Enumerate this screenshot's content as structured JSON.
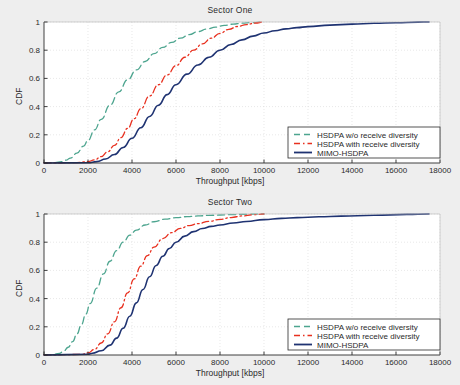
{
  "figure": {
    "background_color": "#eeeeee",
    "plot_background_color": "#ffffff"
  },
  "colors": {
    "series_green": "#4da58f",
    "series_red": "#e8301f",
    "series_navy": "#1f3372",
    "axis": "#2a2a2a",
    "grid": "#d8d8d8"
  },
  "legend": {
    "items": [
      {
        "label": "HSDPA w/o receive diversity",
        "color": "#4da58f",
        "style": "dashed"
      },
      {
        "label": "HSDPA with receive diversity",
        "color": "#e8301f",
        "style": "dash-dot"
      },
      {
        "label": "MIMO-HSDPA",
        "color": "#1f3372",
        "style": "solid"
      }
    ],
    "position": "lower right"
  },
  "chart_data": [
    {
      "type": "line",
      "title": "Sector One",
      "xlabel": "Throughput [kbps]",
      "ylabel": "CDF",
      "xlim": [
        0,
        18000
      ],
      "ylim": [
        0,
        1
      ],
      "xticks": [
        0,
        2000,
        4000,
        6000,
        8000,
        10000,
        12000,
        14000,
        16000,
        18000
      ],
      "yticks": [
        0,
        0.2,
        0.4,
        0.6,
        0.8,
        1
      ],
      "xticklabels": [
        "0",
        "2000",
        "4000",
        "6000",
        "8000",
        "10000",
        "12000",
        "14000",
        "16000",
        "18000"
      ],
      "yticklabels": [
        "0",
        "0.2",
        "0.4",
        "0.6",
        "0.8",
        "1"
      ],
      "grid": true,
      "legend_position": "lower right",
      "series": [
        {
          "name": "HSDPA w/o receive diversity",
          "color": "#4da58f",
          "style": "dashed",
          "x": [
            0,
            500,
            800,
            1000,
            1200,
            1500,
            1800,
            2000,
            2300,
            2600,
            3000,
            3400,
            3800,
            4200,
            4600,
            5000,
            5400,
            5800,
            6200,
            6600,
            7000,
            7400,
            7800,
            8200,
            8600,
            9000,
            9400,
            10000
          ],
          "y": [
            0,
            0.003,
            0.01,
            0.02,
            0.035,
            0.07,
            0.12,
            0.16,
            0.235,
            0.31,
            0.41,
            0.505,
            0.59,
            0.66,
            0.72,
            0.775,
            0.82,
            0.855,
            0.885,
            0.91,
            0.932,
            0.95,
            0.964,
            0.976,
            0.985,
            0.992,
            0.996,
            1.0
          ]
        },
        {
          "name": "HSDPA with receive diversity",
          "color": "#e8301f",
          "style": "dash-dot",
          "x": [
            0,
            1500,
            2000,
            2300,
            2600,
            2900,
            3200,
            3500,
            3800,
            4100,
            4400,
            4800,
            5200,
            5600,
            6000,
            6400,
            6800,
            7200,
            7600,
            8000,
            8400,
            8800,
            9200,
            9600,
            10000
          ],
          "y": [
            0,
            0.003,
            0.01,
            0.022,
            0.045,
            0.08,
            0.125,
            0.18,
            0.245,
            0.315,
            0.385,
            0.475,
            0.555,
            0.625,
            0.69,
            0.75,
            0.8,
            0.845,
            0.885,
            0.92,
            0.948,
            0.968,
            0.982,
            0.993,
            1.0
          ]
        },
        {
          "name": "MIMO-HSDPA",
          "color": "#1f3372",
          "style": "solid",
          "x": [
            0,
            2000,
            2400,
            2800,
            3200,
            3600,
            4000,
            4400,
            4800,
            5200,
            5600,
            6000,
            6500,
            7000,
            7500,
            8000,
            8500,
            9000,
            9500,
            10000,
            10500,
            11000,
            11500,
            12000,
            13000,
            14000,
            15000,
            16000,
            17000,
            17500
          ],
          "y": [
            0,
            0.002,
            0.01,
            0.028,
            0.06,
            0.11,
            0.175,
            0.25,
            0.33,
            0.41,
            0.485,
            0.555,
            0.63,
            0.695,
            0.75,
            0.8,
            0.84,
            0.873,
            0.9,
            0.922,
            0.938,
            0.951,
            0.96,
            0.967,
            0.978,
            0.985,
            0.991,
            0.995,
            0.999,
            1.0
          ]
        }
      ]
    },
    {
      "type": "line",
      "title": "Sector Two",
      "xlabel": "Throughput [kbps]",
      "ylabel": "CDF",
      "xlim": [
        0,
        18000
      ],
      "ylim": [
        0,
        1
      ],
      "xticks": [
        0,
        2000,
        4000,
        6000,
        8000,
        10000,
        12000,
        14000,
        16000,
        18000
      ],
      "yticks": [
        0,
        0.2,
        0.4,
        0.6,
        0.8,
        1
      ],
      "xticklabels": [
        "0",
        "2000",
        "4000",
        "6000",
        "8000",
        "10000",
        "12000",
        "14000",
        "16000",
        "18000"
      ],
      "yticklabels": [
        "0",
        "0.2",
        "0.4",
        "0.6",
        "0.8",
        "1"
      ],
      "grid": true,
      "legend_position": "lower right",
      "series": [
        {
          "name": "HSDPA w/o receive diversity",
          "color": "#4da58f",
          "style": "dashed",
          "x": [
            0,
            400,
            700,
            900,
            1100,
            1300,
            1500,
            1700,
            1900,
            2100,
            2400,
            2700,
            3000,
            3300,
            3600,
            3900,
            4200,
            4600,
            5000,
            5500,
            6000,
            6500,
            7000,
            7500,
            8000,
            8600,
            9200,
            10000
          ],
          "y": [
            0,
            0.003,
            0.012,
            0.028,
            0.055,
            0.095,
            0.15,
            0.215,
            0.29,
            0.365,
            0.475,
            0.575,
            0.665,
            0.74,
            0.8,
            0.85,
            0.885,
            0.922,
            0.945,
            0.963,
            0.974,
            0.981,
            0.986,
            0.99,
            0.993,
            0.996,
            0.998,
            1.0
          ]
        },
        {
          "name": "HSDPA with receive diversity",
          "color": "#e8301f",
          "style": "dash-dot",
          "x": [
            0,
            1700,
            2000,
            2300,
            2600,
            2900,
            3200,
            3500,
            3800,
            4100,
            4400,
            4700,
            5000,
            5400,
            5800,
            6200,
            6600,
            7000,
            7500,
            8000,
            8500,
            9000,
            9500,
            10000
          ],
          "y": [
            0,
            0.004,
            0.015,
            0.04,
            0.085,
            0.15,
            0.235,
            0.335,
            0.44,
            0.54,
            0.63,
            0.705,
            0.765,
            0.825,
            0.868,
            0.898,
            0.918,
            0.932,
            0.948,
            0.962,
            0.975,
            0.986,
            0.995,
            1.0
          ]
        },
        {
          "name": "MIMO-HSDPA",
          "color": "#1f3372",
          "style": "solid",
          "x": [
            0,
            2000,
            2200,
            2600,
            3000,
            3300,
            3600,
            3900,
            4200,
            4500,
            4800,
            5100,
            5400,
            5700,
            6000,
            6400,
            6800,
            7200,
            7600,
            8000,
            8600,
            9200,
            10000,
            10800,
            11500,
            12500,
            13500,
            15000,
            16500,
            17500
          ],
          "y": [
            0,
            0.005,
            0.012,
            0.03,
            0.07,
            0.12,
            0.19,
            0.275,
            0.37,
            0.465,
            0.555,
            0.635,
            0.7,
            0.755,
            0.8,
            0.843,
            0.875,
            0.897,
            0.912,
            0.922,
            0.936,
            0.947,
            0.96,
            0.969,
            0.974,
            0.98,
            0.985,
            0.991,
            0.997,
            1.0
          ]
        }
      ]
    }
  ]
}
